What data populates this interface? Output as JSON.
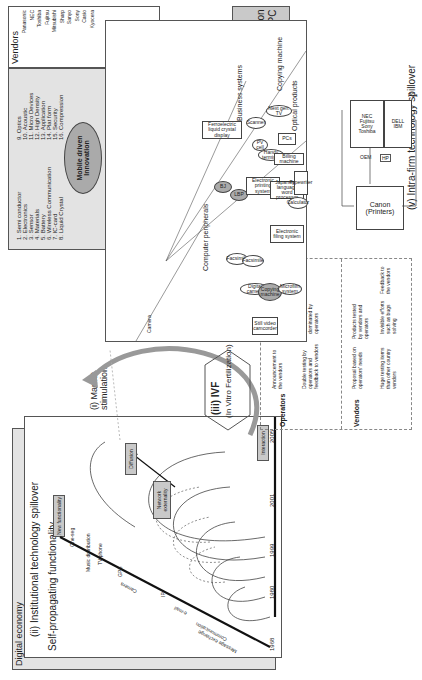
{
  "figure": {
    "digital_economy": {
      "frame_title": "Digital economy",
      "section_title": "(ii) Institutional technology spillover",
      "subtitle": "Self-propagating functionality",
      "new_functionality": "New functionality",
      "functions": [
        "Message exchange",
        "Communication",
        "e-mail",
        "IP",
        "Camera",
        "GPS",
        "TV phone",
        "Music distribution",
        "One-seg"
      ],
      "years": [
        "1968",
        "1980",
        "1999",
        "2001",
        "2005"
      ],
      "network_externality": "Network externality",
      "diffusion": "Diffusion",
      "interaction": "Interaction"
    },
    "market_stimulation": {
      "label": "(i) Market stimulation"
    },
    "ivf": {
      "title": "(iii) IVF",
      "subtitle": "(In Vitro Fertilization)",
      "row_operators": "Operators",
      "row_vendors": "Vendors",
      "op_steps": [
        "Announcement to the vendors",
        "Discussion and adjustment",
        "Double testing by operators and feedback to vendors",
        "Marketing dominated by operators",
        "Operators hear the complains / praise of consumers"
      ],
      "vendor_steps": [
        "Proposal based on operators' needs",
        "Products tested by vendors and operators",
        "Huge testing items than other country vendors",
        "Invisible efforts such as bugs solving",
        "Feedback to the vendors"
      ]
    },
    "mobile_innovation": {
      "center_label": "Mobile driven Innovation",
      "items_left": [
        "1. Semi conductor",
        "2. Electronics",
        "3. Sensor",
        "4. Materials",
        "5. Battery",
        "6. Wireless Communication",
        "7. IC-card",
        "8. Liquid Crystal"
      ],
      "items_right": [
        "9. Optics",
        "10. Acoustic",
        "11. Micro Devices",
        "12. High Density",
        "13. Application",
        "14. Plat form",
        "15. Security",
        "16. Compression"
      ],
      "vendors_title": "Vendors",
      "vendors": [
        "Panasonic",
        "NEC",
        "Toshiba",
        "Fujitsu",
        "Mitsubishi",
        "Sharp",
        "Sanyo",
        "Sony",
        "Casio",
        "Kyocera"
      ]
    },
    "tfl": {
      "label": "TFL and inducement by PC",
      "iv_label": "(iv)",
      "domestication": "Domestication through Coopetition between Printer PC"
    },
    "intra_firm": {
      "title": "(v) Intra-firm technology spillover",
      "legend_commercialized": "Commercialized technologies",
      "legend_suspended": "Suspended technologies",
      "categories": [
        "Copying machine",
        "Business systems",
        "Optical products",
        "Computer peripherals",
        "Camera"
      ],
      "nodes": [
        "Next gen. TV",
        "Scanner",
        "Ferroelectric liquid crystal display",
        "BJ",
        "LBP",
        "PV cell",
        "Handy terminal",
        "PCs",
        "Billing machine",
        "Electronic printing system",
        "Japanese-language word processor",
        "Typewriter",
        "Calculator",
        "Electronic filing system",
        "Facsimile",
        "Facsimile",
        "Digital camera",
        "Copying machine",
        "Still video camcorder",
        "Microfilm system",
        "Synchroreader",
        "Magnetic heads",
        "Semiconductor manufacturing",
        "X-ray digital camera",
        "Ophthalmic equipment",
        "Optical card",
        "TV broadcasting lens",
        "Optical filter",
        "X-ray camera",
        "Lens",
        "Camera",
        "Compact camera",
        "Video camcorder",
        "8 mm Cinecamera"
      ]
    },
    "pc_diagram": {
      "pcs_label": "PCs",
      "japan_pcs": [
        "NEC",
        "Fujitsu",
        "Sony",
        "Toshiba"
      ],
      "us_pcs": [
        "DELL",
        "IBM"
      ],
      "oem_label": "OEM",
      "hp_label": "HP",
      "canon": "Canon (Printers)"
    }
  }
}
